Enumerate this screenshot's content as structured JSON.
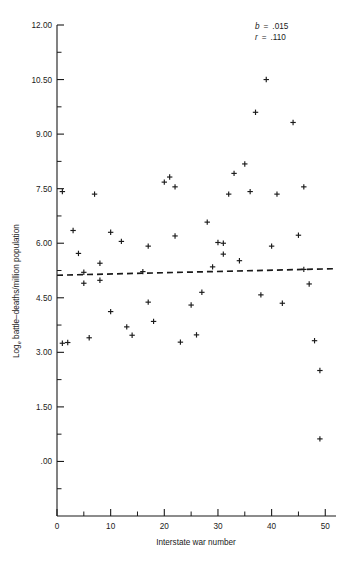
{
  "chart_data": {
    "type": "scatter",
    "title": "",
    "xlabel": "Interstate war number",
    "ylabel": "Log battle–deaths/million population",
    "ylabel_main": "Log",
    "ylabel_subscript": "e",
    "ylabel_rest": " battle–deaths/million population",
    "xlim": [
      0,
      52
    ],
    "ylim": [
      -1.5,
      12.0
    ],
    "grid": false,
    "x_major_ticks": [
      0,
      10,
      20,
      30,
      40,
      50
    ],
    "x_major_tick_labels": [
      "0",
      "10",
      "20",
      "30",
      "40",
      "50"
    ],
    "x_minor_ticks": [
      5,
      15,
      25,
      35,
      45
    ],
    "y_major_ticks": [
      0.0,
      1.5,
      3.0,
      4.5,
      6.0,
      7.5,
      9.0,
      10.5,
      12.0
    ],
    "y_major_tick_labels": [
      ".00",
      "1.50",
      "3.00",
      "4.50",
      "6.00",
      "7.50",
      "9.00",
      "10.50",
      "12.00"
    ],
    "y_minor_ticks": [
      -0.75,
      0.75,
      2.25,
      3.75,
      5.25,
      6.75,
      8.25,
      9.75,
      11.25
    ],
    "marker_symbol": "plus",
    "points": [
      {
        "x": 1,
        "y": 7.42
      },
      {
        "x": 1,
        "y": 3.25
      },
      {
        "x": 2,
        "y": 3.27
      },
      {
        "x": 3,
        "y": 6.35
      },
      {
        "x": 4,
        "y": 5.72
      },
      {
        "x": 5,
        "y": 5.2
      },
      {
        "x": 5,
        "y": 4.9
      },
      {
        "x": 6,
        "y": 3.4
      },
      {
        "x": 7,
        "y": 7.35
      },
      {
        "x": 8,
        "y": 5.45
      },
      {
        "x": 8,
        "y": 4.98
      },
      {
        "x": 10,
        "y": 6.3
      },
      {
        "x": 10,
        "y": 4.12
      },
      {
        "x": 12,
        "y": 6.05
      },
      {
        "x": 13,
        "y": 3.7
      },
      {
        "x": 14,
        "y": 3.47
      },
      {
        "x": 16,
        "y": 5.22
      },
      {
        "x": 17,
        "y": 4.38
      },
      {
        "x": 17,
        "y": 5.92
      },
      {
        "x": 18,
        "y": 3.85
      },
      {
        "x": 20,
        "y": 7.68
      },
      {
        "x": 21,
        "y": 7.82
      },
      {
        "x": 22,
        "y": 7.55
      },
      {
        "x": 22,
        "y": 6.2
      },
      {
        "x": 23,
        "y": 3.28
      },
      {
        "x": 25,
        "y": 4.3
      },
      {
        "x": 26,
        "y": 3.48
      },
      {
        "x": 27,
        "y": 4.65
      },
      {
        "x": 28,
        "y": 6.58
      },
      {
        "x": 29,
        "y": 5.35
      },
      {
        "x": 30,
        "y": 6.02
      },
      {
        "x": 31,
        "y": 6.0
      },
      {
        "x": 31,
        "y": 5.7
      },
      {
        "x": 32,
        "y": 7.35
      },
      {
        "x": 33,
        "y": 7.92
      },
      {
        "x": 34,
        "y": 5.52
      },
      {
        "x": 35,
        "y": 8.18
      },
      {
        "x": 36,
        "y": 7.42
      },
      {
        "x": 37,
        "y": 9.6
      },
      {
        "x": 38,
        "y": 4.58
      },
      {
        "x": 39,
        "y": 10.5
      },
      {
        "x": 40,
        "y": 5.92
      },
      {
        "x": 41,
        "y": 7.35
      },
      {
        "x": 42,
        "y": 4.35
      },
      {
        "x": 44,
        "y": 9.32
      },
      {
        "x": 45,
        "y": 6.22
      },
      {
        "x": 46,
        "y": 7.55
      },
      {
        "x": 46,
        "y": 5.28
      },
      {
        "x": 47,
        "y": 4.88
      },
      {
        "x": 48,
        "y": 3.32
      },
      {
        "x": 49,
        "y": 2.5
      },
      {
        "x": 49,
        "y": 0.62
      }
    ],
    "fit_line": {
      "style": "dashed",
      "x_start": 0,
      "y_start": 5.12,
      "x_end": 52,
      "y_end": 5.3
    },
    "annotations": [
      {
        "symbol": "b",
        "equals": "=",
        "value": ".015"
      },
      {
        "symbol": "r",
        "equals": "=",
        "value": ".110"
      }
    ]
  }
}
